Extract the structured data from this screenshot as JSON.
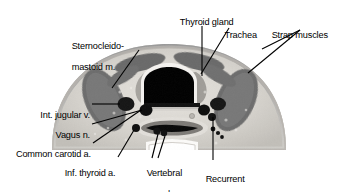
{
  "figure": {
    "type": "anatomical-cross-section",
    "region": "neck transverse section",
    "background_color": "#ffffff",
    "line_color": "#000000",
    "text_color": "#000000"
  },
  "labels": [
    {
      "id": "thyroid-gland",
      "text": "Thyroid gland",
      "lines": [
        "Thyroid gland"
      ]
    },
    {
      "id": "trachea",
      "text": "Trachea",
      "lines": [
        "Trachea"
      ]
    },
    {
      "id": "strap-muscles",
      "text": "Strap muscles",
      "lines": [
        "Strap muscles"
      ]
    },
    {
      "id": "sternocleidomastoid-muscle",
      "text": "Sternocleido-mastoid m.",
      "lines": [
        "Sternocleido-",
        "mastoid m."
      ]
    },
    {
      "id": "internal-jugular-vein",
      "text": "Int. jugular v.",
      "lines": [
        "Int. jugular v."
      ]
    },
    {
      "id": "vagus-nerve",
      "text": "Vagus n.",
      "lines": [
        "Vagus n."
      ]
    },
    {
      "id": "common-carotid-artery",
      "text": "Common carotid a.",
      "lines": [
        "Common carotid a."
      ]
    },
    {
      "id": "inferior-thyroid-artery",
      "text": "Inf. thyroid a.",
      "lines": [
        "Inf. thyroid a."
      ]
    },
    {
      "id": "vertebral-vein-and-artery",
      "text": "Vertebral v. and a.",
      "lines": [
        "Vertebral",
        "v. and a."
      ]
    },
    {
      "id": "recurrent-laryngeal-nerve",
      "text": "Recurrent laryngeal n.",
      "lines": [
        "Recurrent",
        "laryngeal n."
      ]
    }
  ],
  "structures": {
    "trachea_lumen_color": "#000000",
    "cartilage_color": "#f2f0ec",
    "muscle_color": "#6e6e6e",
    "soft_tissue_color": "#c9c6c1",
    "vessel_color": "#141414",
    "skin_edge_color": "#8a8a8a"
  }
}
